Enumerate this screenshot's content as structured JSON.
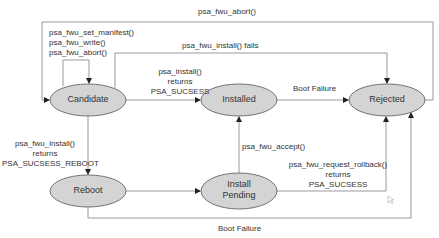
{
  "diagram": {
    "type": "state-machine",
    "colors": {
      "state_fill": "#d4d4d4",
      "state_stroke": "#555555",
      "edge": "#999999",
      "arrowhead": "#222222",
      "text": "#333333"
    },
    "states": [
      {
        "id": "candidate",
        "label": "Candidate"
      },
      {
        "id": "installed",
        "label": "Installed"
      },
      {
        "id": "rejected",
        "label": "Rejected"
      },
      {
        "id": "reboot",
        "label": "Reboot"
      },
      {
        "id": "install_pending",
        "label_line1": "Install",
        "label_line2": "Pending"
      }
    ],
    "transitions": {
      "abort_top": {
        "from": "rejected",
        "to": "candidate",
        "label": "psa_fwu_abort()"
      },
      "self_loop": {
        "from": "candidate",
        "to": "candidate",
        "line1": "psa_fwu_set_manifest()",
        "line2": "psa_fwu_write()",
        "line3": "psa_fwu_abort()"
      },
      "install_fails": {
        "from": "candidate",
        "to": "rejected",
        "label": "psa_fwu_install() fails"
      },
      "install_success": {
        "from": "candidate",
        "to": "installed",
        "line1": "psa_install()",
        "line2": "returns",
        "line3": "PSA_SUCSESS"
      },
      "installed_boot_failure": {
        "from": "installed",
        "to": "rejected",
        "label": "Boot Failure"
      },
      "install_reboot": {
        "from": "candidate",
        "to": "reboot",
        "line1": "psa_fwu_install()",
        "line2": "returns",
        "line3": "PSA_SUCSESS_REBOOT"
      },
      "reboot_to_pending": {
        "from": "reboot",
        "to": "install_pending"
      },
      "accept": {
        "from": "install_pending",
        "to": "installed",
        "label": "psa_fwu_accept()"
      },
      "rollback": {
        "from": "install_pending",
        "to": "rejected",
        "line1": "psa_fwu_request_rollback()",
        "line2": "returns",
        "line3": "PSA_SUCSESS"
      },
      "reboot_boot_failure": {
        "from": "reboot",
        "to": "rejected",
        "label": "Boot Failure"
      }
    }
  }
}
